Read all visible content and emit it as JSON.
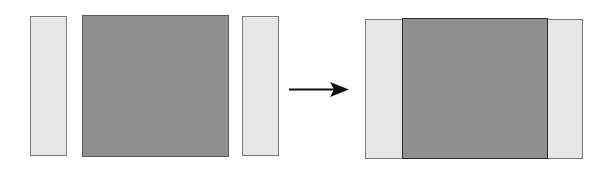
{
  "diagram": {
    "before": {
      "left_panel": {
        "color": "#e6e6e6"
      },
      "center_block": {
        "color": "#8f8f8f"
      },
      "right_panel": {
        "color": "#e6e6e6"
      }
    },
    "arrow": {
      "direction": "right",
      "color": "#111111"
    },
    "after": {
      "left_panel": {
        "color": "#e6e6e6"
      },
      "center_block": {
        "color": "#8f8f8f"
      },
      "right_panel": {
        "color": "#e6e6e6"
      }
    }
  }
}
